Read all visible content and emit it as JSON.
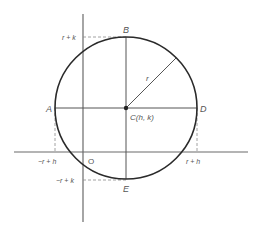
{
  "diagram": {
    "colors": {
      "background": "#ffffff",
      "circle": "#2a2a2a",
      "axes": "#6a6a6a",
      "lines": "#555555",
      "dashes": "#8a8a8a",
      "text": "#555555"
    },
    "geometry": {
      "center": [
        126,
        108
      ],
      "radius": 71,
      "x_axis": {
        "y": 152,
        "x1": 14,
        "x2": 248
      },
      "y_axis": {
        "x": 83,
        "y1": 14,
        "y2": 222
      },
      "radius_end": [
        176,
        58
      ]
    },
    "labels": {
      "point_a": "A",
      "point_b": "B",
      "point_d": "D",
      "point_e": "E",
      "center": "C(h, k)",
      "radius": "r",
      "origin": "O",
      "tick_r_plus_k": "r + k",
      "tick_neg_r_plus_k": "−r + k",
      "tick_neg_r_plus_h": "−r + h",
      "tick_r_plus_h": "r + h"
    }
  }
}
